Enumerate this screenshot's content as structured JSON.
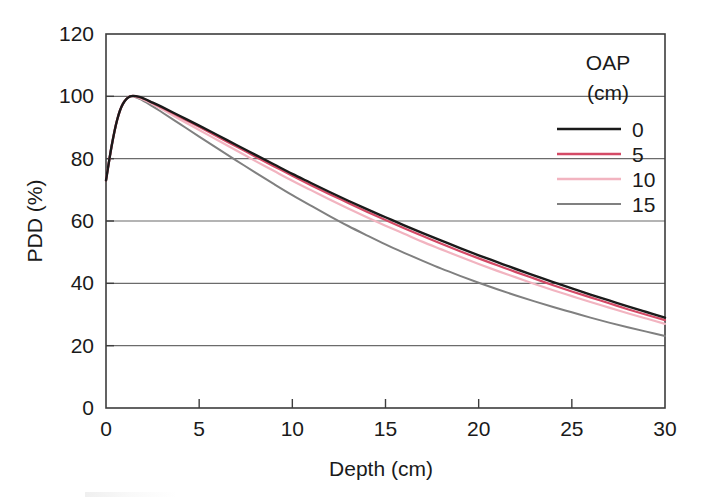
{
  "chart_data": {
    "type": "line",
    "title": "",
    "xlabel": "Depth (cm)",
    "ylabel": "PDD (%)",
    "xlim": [
      0,
      30
    ],
    "ylim": [
      0,
      120
    ],
    "xticks": [
      0,
      5,
      10,
      15,
      20,
      25,
      30
    ],
    "yticks": [
      0,
      20,
      40,
      60,
      80,
      100,
      120
    ],
    "xtick_labels": [
      "0",
      "5",
      "10",
      "15",
      "20",
      "25",
      "30"
    ],
    "ytick_labels": [
      "0",
      "20",
      "40",
      "60",
      "80",
      "100",
      "120"
    ],
    "grid": "horizontal",
    "legend_position": "upper-right-inside",
    "legend_title": "OAP",
    "legend_title_unit": "(cm)",
    "x": [
      0,
      0.3,
      0.6,
      0.9,
      1.3,
      1.8,
      2.5,
      3,
      4,
      5,
      6,
      7,
      8,
      9,
      10,
      11,
      12,
      13,
      14,
      15,
      16,
      17,
      18,
      19,
      20,
      21,
      22,
      23,
      24,
      25,
      26,
      27,
      28,
      29,
      30
    ],
    "series": [
      {
        "name": "0",
        "label": "0",
        "color": "#1a1a1a",
        "width": 2.4,
        "values": [
          73.0,
          84.0,
          92.5,
          97.5,
          100.0,
          99.8,
          98.0,
          96.6,
          93.6,
          90.6,
          87.5,
          84.4,
          81.3,
          78.2,
          75.1,
          72.2,
          69.3,
          66.5,
          63.8,
          61.2,
          58.6,
          56.1,
          53.7,
          51.3,
          49.0,
          46.8,
          44.6,
          42.5,
          40.4,
          38.4,
          36.4,
          34.5,
          32.6,
          30.8,
          29.0
        ]
      },
      {
        "name": "5",
        "label": "5",
        "color": "#d44a66",
        "width": 2.2,
        "values": [
          73.0,
          84.0,
          92.5,
          97.5,
          100.0,
          99.7,
          97.9,
          96.4,
          93.3,
          90.2,
          87.0,
          83.9,
          80.7,
          77.6,
          74.5,
          71.5,
          68.6,
          65.8,
          63.0,
          60.3,
          57.7,
          55.2,
          52.7,
          50.3,
          48.0,
          45.8,
          43.6,
          41.5,
          39.4,
          37.4,
          35.5,
          33.6,
          31.7,
          29.9,
          28.2
        ]
      },
      {
        "name": "10",
        "label": "10",
        "color": "#f2b4c0",
        "width": 2.2,
        "values": [
          73.0,
          84.0,
          92.5,
          97.5,
          100.0,
          99.5,
          97.5,
          95.9,
          92.5,
          89.2,
          85.9,
          82.6,
          79.3,
          76.1,
          72.9,
          69.9,
          66.9,
          64.0,
          61.2,
          58.5,
          55.9,
          53.3,
          50.9,
          48.5,
          46.2,
          44.0,
          41.9,
          39.8,
          37.8,
          35.9,
          34.0,
          32.2,
          30.4,
          28.7,
          27.0
        ]
      },
      {
        "name": "15",
        "label": "15",
        "color": "#808080",
        "width": 2.0,
        "values": [
          73.0,
          84.0,
          92.5,
          97.5,
          100.0,
          99.2,
          96.8,
          94.9,
          91.0,
          87.1,
          83.2,
          79.4,
          75.6,
          71.9,
          68.3,
          64.9,
          61.6,
          58.4,
          55.4,
          52.5,
          49.8,
          47.2,
          44.7,
          42.4,
          40.2,
          38.1,
          36.1,
          34.2,
          32.4,
          30.7,
          29.0,
          27.4,
          25.9,
          24.5,
          23.1
        ]
      }
    ],
    "legend_entries": [
      {
        "label": "0",
        "color": "#1a1a1a"
      },
      {
        "label": "5",
        "color": "#d44a66"
      },
      {
        "label": "10",
        "color": "#f2b4c0"
      },
      {
        "label": "15",
        "color": "#808080"
      }
    ]
  }
}
